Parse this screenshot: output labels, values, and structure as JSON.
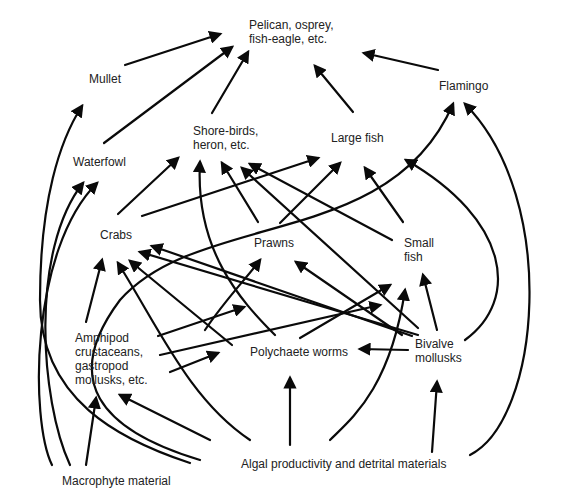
{
  "diagram": {
    "type": "food-web",
    "nodes": [
      {
        "id": "pelican",
        "label": "Pelican, osprey,\nfish-eagle, etc.",
        "x": 249,
        "y": 18
      },
      {
        "id": "mullet",
        "label": "Mullet",
        "x": 89,
        "y": 72
      },
      {
        "id": "flamingo",
        "label": "Flamingo",
        "x": 439,
        "y": 79
      },
      {
        "id": "shorebirds",
        "label": "Shore-birds,\nheron, etc.",
        "x": 193,
        "y": 124
      },
      {
        "id": "largefish",
        "label": "Large fish",
        "x": 331,
        "y": 131
      },
      {
        "id": "waterfowl",
        "label": "Waterfowl",
        "x": 73,
        "y": 155
      },
      {
        "id": "crabs",
        "label": "Crabs",
        "x": 100,
        "y": 228
      },
      {
        "id": "prawns",
        "label": "Prawns",
        "x": 254,
        "y": 236
      },
      {
        "id": "smallfish",
        "label": "Small\nfish",
        "x": 404,
        "y": 236
      },
      {
        "id": "amphipod",
        "label": "Amphipod\ncrustaceans,\ngastropod\nmollusks, etc.",
        "x": 75,
        "y": 331
      },
      {
        "id": "polychaete",
        "label": "Polychaete worms",
        "x": 250,
        "y": 345
      },
      {
        "id": "bivalve",
        "label": "Bivalve\nmollusks",
        "x": 415,
        "y": 337
      },
      {
        "id": "macrophyte",
        "label": "Macrophyte material",
        "x": 62,
        "y": 474
      },
      {
        "id": "algal",
        "label": "Algal productivity and detrital materials",
        "x": 241,
        "y": 457
      }
    ],
    "edges": [
      {
        "from": "mullet",
        "to": "pelican",
        "d": "M125,65 L220,34"
      },
      {
        "from": "waterfowl",
        "to": "pelican",
        "d": "M104,143 L232,47"
      },
      {
        "from": "shorebirds",
        "to": "pelican",
        "d": "M212,113 L248,52"
      },
      {
        "from": "largefish",
        "to": "pelican",
        "d": "M353,112 L315,66"
      },
      {
        "from": "flamingo",
        "to": "pelican",
        "d": "M438,70 L364,53"
      },
      {
        "from": "crabs",
        "to": "shorebirds",
        "d": "M118,214 L178,158"
      },
      {
        "from": "crabs",
        "to": "largefish",
        "d": "M142,216 L318,158"
      },
      {
        "from": "prawns",
        "to": "shorebirds",
        "d": "M258,222 L222,163"
      },
      {
        "from": "prawns",
        "to": "largefish",
        "d": "M280,223 L340,163"
      },
      {
        "from": "smallfish",
        "to": "shorebirds",
        "d": "M392,240 L250,164"
      },
      {
        "from": "smallfish",
        "to": "largefish",
        "d": "M403,222 L365,168"
      },
      {
        "from": "polychaete",
        "to": "shorebirds",
        "d": "M275,335 C240,300 195,250 200,162"
      },
      {
        "from": "bivalve",
        "to": "shorebirds",
        "d": "M418,328 L242,168"
      },
      {
        "from": "bivalve",
        "to": "largefish",
        "d": "M465,340 C520,300 510,220 406,160"
      },
      {
        "from": "amphipod",
        "to": "crabs",
        "d": "M86,322 L102,260"
      },
      {
        "from": "polychaete",
        "to": "crabs",
        "d": "M232,345 L130,261"
      },
      {
        "from": "bivalve",
        "to": "crabs",
        "d": "M412,336 L152,246"
      },
      {
        "from": "smallfish",
        "to": "crabs",
        "d": "M418,335 L140,252"
      },
      {
        "from": "amphipod",
        "to": "prawns",
        "d": "M158,336 L244,307"
      },
      {
        "from": "amphipod",
        "to": "smallfish",
        "d": "M160,355 L380,305"
      },
      {
        "from": "amphipod",
        "to": "polychaete",
        "d": "M170,372 L218,353"
      },
      {
        "from": "polychaete",
        "to": "prawns",
        "d": "M205,330 C225,300 245,280 260,260"
      },
      {
        "from": "polychaete",
        "to": "smallfish",
        "d": "M300,338 L390,285"
      },
      {
        "from": "bivalve",
        "to": "prawns",
        "d": "M402,335 L296,262"
      },
      {
        "from": "bivalve",
        "to": "smallfish",
        "d": "M437,330 L423,275"
      },
      {
        "from": "bivalve",
        "to": "polychaete",
        "d": "M408,350 L360,349"
      },
      {
        "from": "algal",
        "to": "smallfish",
        "d": "M330,440 C350,420 390,390 405,290"
      },
      {
        "from": "algal",
        "to": "polychaete",
        "d": "M290,445 L290,378"
      },
      {
        "from": "algal",
        "to": "amphipod",
        "d": "M210,440 L120,395"
      },
      {
        "from": "algal",
        "to": "crabs",
        "d": "M250,440 C190,400 160,330 118,263"
      },
      {
        "from": "algal",
        "to": "bivalve",
        "d": "M432,452 L437,382"
      },
      {
        "from": "algal",
        "to": "flamingo",
        "d": "M470,455 C540,420 560,200 465,104"
      },
      {
        "from": "macrophyte",
        "to": "amphipod",
        "d": "M86,465 L96,398"
      },
      {
        "from": "macrophyte",
        "to": "waterfowl",
        "d": "M70,465 C40,400 30,250 83,183"
      },
      {
        "from": "macrophyte",
        "to": "waterfowl-2",
        "d": "M52,465 C30,420 30,250 97,183"
      },
      {
        "from": "algal",
        "to": "mullet",
        "d": "M190,463 C120,440 40,400 40,300 C40,200 60,140 82,106"
      },
      {
        "from": "algal",
        "to": "flamingo-2",
        "d": "M200,460 C100,430 60,380 120,300 C200,210 390,250 453,104"
      }
    ]
  }
}
